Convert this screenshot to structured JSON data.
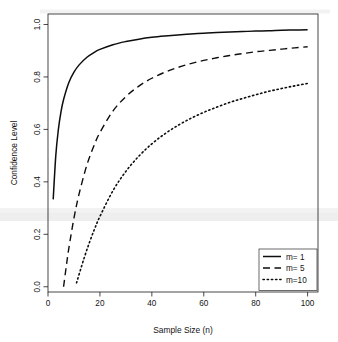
{
  "figure": {
    "name": "confidence-level-vs-sample-size-plot",
    "background_color": "#ffffff",
    "foreground_color": "#111111"
  },
  "chart_data": {
    "type": "line",
    "title": "",
    "subtitle": "",
    "xlabel": "Sample Size (n)",
    "ylabel": "Confidence Level",
    "xlim": [
      0,
      104
    ],
    "ylim": [
      -0.02,
      1.04
    ],
    "xticks": [
      0,
      20,
      40,
      60,
      80,
      100
    ],
    "xticklabels": [
      "0",
      "20",
      "40",
      "60",
      "80",
      "100"
    ],
    "yticks": [
      0.0,
      0.2,
      0.4,
      0.6,
      0.8,
      1.0
    ],
    "yticklabels": [
      "0.0",
      "0.2",
      "0.4",
      "0.6",
      "0.8",
      "1.0"
    ],
    "grid": false,
    "legend_position": "bottom-right",
    "box_style": "full-rectangle",
    "series": [
      {
        "name": "m= 1",
        "legend_label": "m= 1",
        "linestyle": "solid",
        "color": "#0d0d0d",
        "linewidth": 1.5,
        "x": [
          2,
          3,
          4,
          5,
          6,
          8,
          10,
          12,
          15,
          18,
          20,
          25,
          30,
          35,
          40,
          45,
          50,
          55,
          60,
          65,
          70,
          75,
          80,
          85,
          90,
          95,
          100
        ],
        "y": [
          0.333,
          0.5,
          0.6,
          0.667,
          0.714,
          0.778,
          0.818,
          0.846,
          0.875,
          0.895,
          0.905,
          0.923,
          0.935,
          0.944,
          0.951,
          0.956,
          0.96,
          0.964,
          0.967,
          0.969,
          0.971,
          0.973,
          0.975,
          0.976,
          0.978,
          0.979,
          0.98
        ]
      },
      {
        "name": "m= 5",
        "legend_label": "m= 5",
        "linestyle": "dashed",
        "color": "#0d0d0d",
        "linewidth": 1.4,
        "x": [
          6,
          7,
          8,
          10,
          12,
          15,
          18,
          20,
          25,
          30,
          35,
          40,
          45,
          50,
          55,
          60,
          65,
          70,
          75,
          80,
          85,
          90,
          95,
          100
        ],
        "y": [
          0.0,
          0.075,
          0.145,
          0.262,
          0.355,
          0.465,
          0.545,
          0.588,
          0.67,
          0.725,
          0.765,
          0.795,
          0.818,
          0.836,
          0.851,
          0.863,
          0.873,
          0.882,
          0.889,
          0.896,
          0.901,
          0.906,
          0.911,
          0.915
        ]
      },
      {
        "name": "m=10",
        "legend_label": "m=10",
        "linestyle": "dotted",
        "color": "#0d0d0d",
        "linewidth": 1.6,
        "x": [
          11,
          12,
          14,
          16,
          18,
          20,
          25,
          30,
          35,
          40,
          45,
          50,
          55,
          60,
          65,
          70,
          75,
          80,
          85,
          90,
          95,
          100
        ],
        "y": [
          0.015,
          0.048,
          0.112,
          0.17,
          0.222,
          0.268,
          0.366,
          0.44,
          0.498,
          0.545,
          0.583,
          0.615,
          0.642,
          0.665,
          0.685,
          0.703,
          0.718,
          0.732,
          0.745,
          0.756,
          0.766,
          0.775
        ]
      }
    ]
  },
  "legend": {
    "name": "series-legend",
    "entries": [
      {
        "label": "m= 1",
        "style": "solid"
      },
      {
        "label": "m= 5",
        "style": "dashed"
      },
      {
        "label": "m=10",
        "style": "dotted"
      }
    ]
  },
  "artifacts": {
    "scan_band_note": "faint horizontal light-gray scan bands"
  }
}
